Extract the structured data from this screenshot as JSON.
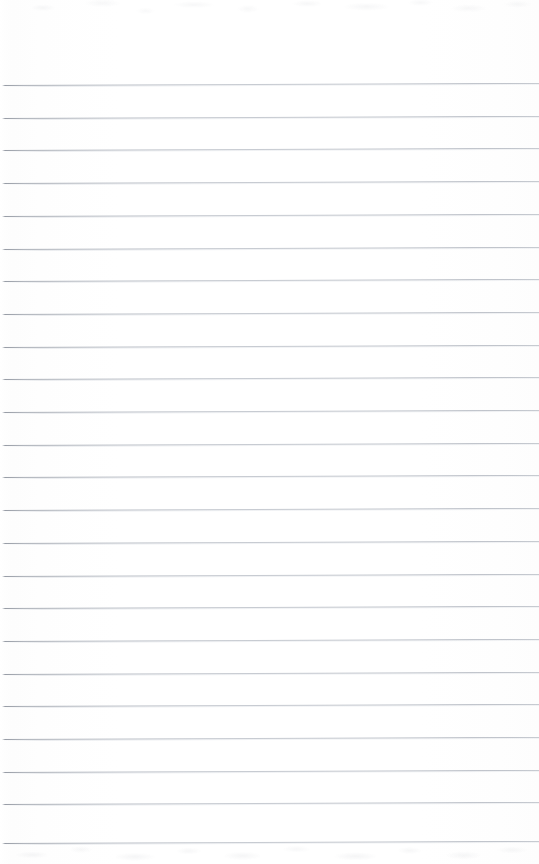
{
  "document": {
    "kind": "scanned-ruled-notepad-page",
    "title": "Blank Ruled Notepad Page",
    "description": "A scan of an empty lined notepad sheet with no handwriting, print, or marks.",
    "content_text": "",
    "width_px": 539,
    "height_px": 864
  },
  "paper": {
    "background_color": "#ffffff",
    "edge_tint_color": "#fdfdfd",
    "texture_color": "#a0a4ac",
    "orientation": "portrait"
  },
  "ruling": {
    "line_color": "#9aa0ab",
    "line_fade_color": "#aab0ba",
    "halo_color": "#bac0ca",
    "line_count": 24,
    "first_line_y": 85,
    "line_spacing_px": 32.7,
    "line_thickness_px": 1,
    "left_inset_px": 2,
    "right_inset_px": 0,
    "skew_degrees": -0.22,
    "lines_y": [
      85.0,
      117.7,
      150.4,
      183.1,
      215.8,
      248.5,
      281.2,
      313.9,
      346.6,
      379.3,
      412.0,
      444.7,
      477.4,
      510.1,
      542.8,
      575.5,
      608.2,
      640.9,
      673.6,
      706.3,
      739.0,
      771.7,
      804.4,
      843.0
    ]
  },
  "margins": {
    "top_blank_px": 85,
    "bottom_texture_band_px": 21,
    "top_texture_band_px": 26,
    "has_vertical_margin_rule": false
  },
  "annotations": {
    "handwriting_present": false,
    "printed_text_present": false,
    "marks_present": false
  }
}
